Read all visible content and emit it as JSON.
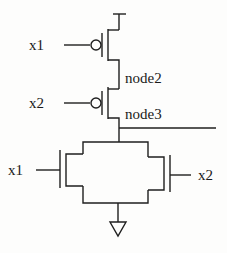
{
  "diagram": {
    "type": "CMOS transistor schematic",
    "labels": {
      "top_input_1": "x1",
      "top_input_2": "x2",
      "node_a": "node2",
      "node_b": "node3",
      "bottom_input_left": "x1",
      "bottom_input_right": "x2"
    },
    "components": [
      {
        "id": "pmos-1",
        "kind": "PMOS",
        "gate": "x1"
      },
      {
        "id": "pmos-2",
        "kind": "PMOS",
        "gate": "x2"
      },
      {
        "id": "nmos-1",
        "kind": "NMOS",
        "gate": "x1"
      },
      {
        "id": "nmos-2",
        "kind": "NMOS",
        "gate": "x2"
      }
    ],
    "colors": {
      "line": "#1f1f1f",
      "background": "#fdfdfc"
    }
  }
}
